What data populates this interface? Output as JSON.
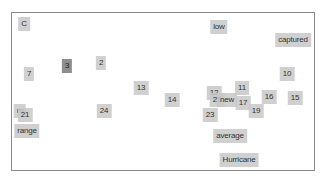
{
  "chart_data": {
    "type": "scatter",
    "title": "",
    "xlabel": "",
    "ylabel": "",
    "grid": false,
    "legend": null,
    "points": [
      {
        "label": "C",
        "x": 24,
        "y": 24
      },
      {
        "label": "7",
        "x": 29,
        "y": 74
      },
      {
        "label": "3",
        "x": 67,
        "y": 66,
        "emphasis": "dark",
        "note": "overlaps another label"
      },
      {
        "label": "2",
        "x": 101,
        "y": 63
      },
      {
        "label": "13",
        "x": 141,
        "y": 88
      },
      {
        "label": "14",
        "x": 172,
        "y": 100
      },
      {
        "label": "low",
        "x": 219,
        "y": 27
      },
      {
        "label": "captured",
        "x": 293,
        "y": 40
      },
      {
        "label": "10",
        "x": 287,
        "y": 74
      },
      {
        "label": "11",
        "x": 242,
        "y": 88
      },
      {
        "label": "12",
        "x": 214,
        "y": 93
      },
      {
        "label": "25",
        "x": 217,
        "y": 100
      },
      {
        "label": "new",
        "x": 227,
        "y": 100
      },
      {
        "label": "17",
        "x": 243,
        "y": 103
      },
      {
        "label": "16",
        "x": 269,
        "y": 97
      },
      {
        "label": "15",
        "x": 295,
        "y": 98
      },
      {
        "label": "19",
        "x": 256,
        "y": 111
      },
      {
        "label": "23",
        "x": 210,
        "y": 115
      },
      {
        "label": "24",
        "x": 104,
        "y": 111
      },
      {
        "label": "m",
        "x": 20,
        "y": 111
      },
      {
        "label": "21",
        "x": 25,
        "y": 115
      },
      {
        "label": "range",
        "x": 27,
        "y": 131
      },
      {
        "label": "average",
        "x": 230,
        "y": 136
      },
      {
        "label": "Hurricane",
        "x": 239,
        "y": 160
      }
    ]
  }
}
